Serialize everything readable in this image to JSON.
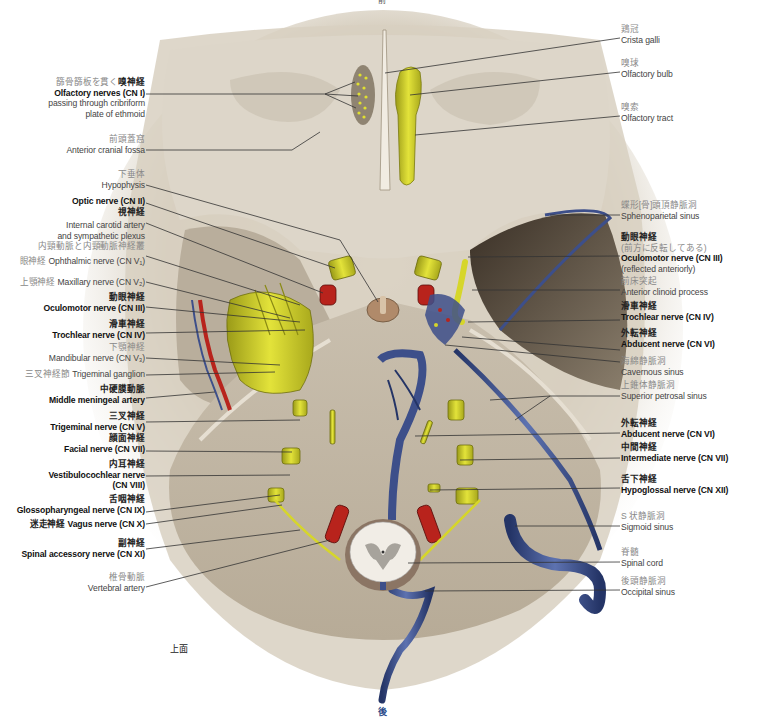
{
  "figure": {
    "view_label": "上面",
    "top_orientation": "前",
    "bottom_orientation": "後",
    "colors": {
      "bone": "#d9d1c4",
      "bone_shadow": "#a89e8c",
      "nerve": "#d6d62a",
      "artery": "#b8231c",
      "vein": "#3d4f8a",
      "leader_line": "#333333"
    }
  },
  "labels_left": [
    {
      "jp": "篩骨篩板を貫く",
      "jp_bold": "嗅神経",
      "en": "Olfactory nerves (CN I)",
      "en2": "passing through cribriform",
      "en3": "plate of ethmoid"
    },
    {
      "jp": "前頭蓋窩",
      "en": "Anterior cranial fossa"
    },
    {
      "jp": "下垂体",
      "en": "Hypophysis"
    },
    {
      "en": "Optic nerve (CN II)",
      "jp": "視神経"
    },
    {
      "en": "Internal carotid artery",
      "en2": "and sympathetic plexus",
      "jp": "内頸動脈と内頸動脈神経叢"
    },
    {
      "jp": "眼神経",
      "en": "Ophthalmic nerve (CN V₁)"
    },
    {
      "jp": "上顎神経",
      "en": "Maxillary nerve (CN V₂)"
    },
    {
      "jp": "動眼神経",
      "en": "Oculomotor nerve (CN III)"
    },
    {
      "jp": "滑車神経",
      "en": "Trochlear nerve (CN IV)"
    },
    {
      "jp": "下顎神経",
      "en": "Mandibular nerve (CN V₃)"
    },
    {
      "jp": "三叉神経節",
      "en": "Trigeminal ganglion"
    },
    {
      "jp": "中硬膜動脈",
      "en": "Middle meningeal artery"
    },
    {
      "jp": "三叉神経",
      "en": "Trigeminal nerve (CN V)"
    },
    {
      "jp": "顔面神経",
      "en": "Facial nerve (CN VII)"
    },
    {
      "jp": "内耳神経",
      "en": "Vestibulocochlear nerve",
      "en2": "(CN VIII)"
    },
    {
      "jp": "舌咽神経",
      "en": "Glossopharyngeal nerve (CN IX)"
    },
    {
      "jp": "迷走神経",
      "en": "Vagus nerve (CN X)"
    },
    {
      "jp": "副神経",
      "en": "Spinal accessory nerve (CN XI)"
    },
    {
      "jp": "椎骨動脈",
      "en": "Vertebral artery"
    }
  ],
  "labels_right": [
    {
      "jp": "鶏冠",
      "en": "Crista galli"
    },
    {
      "jp": "嗅球",
      "en": "Olfactory bulb"
    },
    {
      "jp": "嗅索",
      "en": "Olfactory tract"
    },
    {
      "jp": "蝶形[骨]頭頂静脈洞",
      "en": "Sphenoparietal sinus"
    },
    {
      "jp": "動眼神経",
      "jp2": "(前方に反転してある)",
      "en": "Oculomotor nerve (CN III)",
      "en2": "(reflected anteriorly)"
    },
    {
      "jp": "前床突起",
      "en": "Anterior clinoid process"
    },
    {
      "jp": "滑車神経",
      "en": "Trochlear nerve (CN IV)"
    },
    {
      "jp": "外転神経",
      "en": "Abducent nerve (CN VI)"
    },
    {
      "jp": "海綿静脈洞",
      "en": "Cavernous sinus"
    },
    {
      "jp": "上錐体静脈洞",
      "en": "Superior petrosal sinus"
    },
    {
      "jp": "外転神経",
      "en": "Abducent nerve (CN VI)"
    },
    {
      "jp": "中間神経",
      "en": "Intermediate nerve (CN VII)"
    },
    {
      "jp": "舌下神経",
      "en": "Hypoglossal nerve (CN XII)"
    },
    {
      "jp": "S 状静脈洞",
      "en": "Sigmoid sinus"
    },
    {
      "jp": "脊髄",
      "en": "Spinal cord"
    },
    {
      "jp": "後頭静脈洞",
      "en": "Occipital sinus"
    }
  ]
}
